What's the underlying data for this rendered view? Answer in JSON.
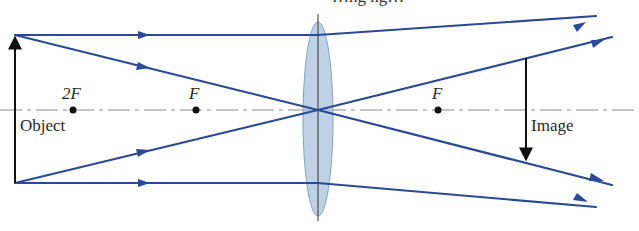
{
  "title_partial": "…ng ng…",
  "labels": {
    "two_f": "2F",
    "f_left": "F",
    "f_right": "F",
    "object": "Object",
    "image": "Image"
  },
  "colors": {
    "ray": "#2b4a96",
    "axis": "#777777",
    "arrow": "#111111",
    "lens_fill": "#a9c3dc",
    "lens_stroke": "#7fa3c6",
    "dot": "#111111"
  },
  "geometry": {
    "optical_axis_y": 110,
    "lens_x": 318,
    "object": {
      "x": 15,
      "top": 35,
      "bottom": 183
    },
    "image": {
      "x": 526,
      "top": 58,
      "bottom": 162
    },
    "focal_points": {
      "two_f_left_x": 73,
      "f_left_x": 196,
      "f_right_x": 438
    }
  },
  "rays": [
    {
      "name": "parallel-top",
      "points": [
        [
          15,
          35
        ],
        [
          318,
          35
        ],
        [
          596,
          16
        ]
      ]
    },
    {
      "name": "through-center-top",
      "points": [
        [
          15,
          35
        ],
        [
          318,
          110
        ],
        [
          612,
          185
        ]
      ]
    },
    {
      "name": "through-center-bottom",
      "points": [
        [
          15,
          183
        ],
        [
          318,
          110
        ],
        [
          612,
          37
        ]
      ]
    },
    {
      "name": "parallel-bottom",
      "points": [
        [
          15,
          183
        ],
        [
          318,
          183
        ],
        [
          596,
          207
        ]
      ]
    }
  ]
}
